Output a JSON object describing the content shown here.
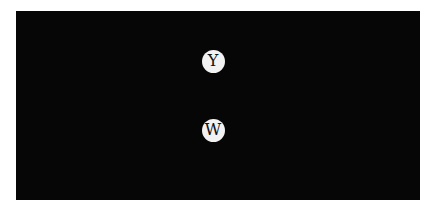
{
  "board": {
    "background": "#060606"
  },
  "tokens": [
    {
      "label": "Y",
      "cx": 213,
      "cy": 61
    },
    {
      "label": "W",
      "cx": 213,
      "cy": 130
    }
  ]
}
